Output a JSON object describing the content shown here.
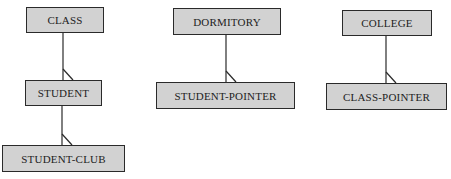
{
  "diagram": {
    "type": "hierarchical-data-model",
    "fill_color": "#d2d2d2",
    "stroke_color": "#2a2a2a",
    "nodes": [
      {
        "id": "class",
        "label": "CLASS",
        "x": 26,
        "y": 7,
        "w": 78,
        "h": 26
      },
      {
        "id": "student",
        "label": "STUDENT",
        "x": 25,
        "y": 80,
        "w": 77,
        "h": 26
      },
      {
        "id": "student_club",
        "label": "STUDENT-CLUB",
        "x": 2,
        "y": 145,
        "w": 123,
        "h": 27
      },
      {
        "id": "dormitory",
        "label": "DORMITORY",
        "x": 173,
        "y": 8,
        "w": 108,
        "h": 27
      },
      {
        "id": "student_pointer",
        "label": "STUDENT-POINTER",
        "x": 156,
        "y": 82,
        "w": 139,
        "h": 27
      },
      {
        "id": "college",
        "label": "COLLEGE",
        "x": 342,
        "y": 10,
        "w": 90,
        "h": 26
      },
      {
        "id": "class_pointer",
        "label": "CLASS-POINTER",
        "x": 326,
        "y": 83,
        "w": 121,
        "h": 27
      }
    ],
    "edges": [
      {
        "from": "class",
        "to": "student",
        "cardinality": "one-to-many"
      },
      {
        "from": "student",
        "to": "student_club",
        "cardinality": "one-to-many"
      },
      {
        "from": "dormitory",
        "to": "student_pointer",
        "cardinality": "one-to-many"
      },
      {
        "from": "college",
        "to": "class_pointer",
        "cardinality": "one-to-many"
      }
    ]
  }
}
